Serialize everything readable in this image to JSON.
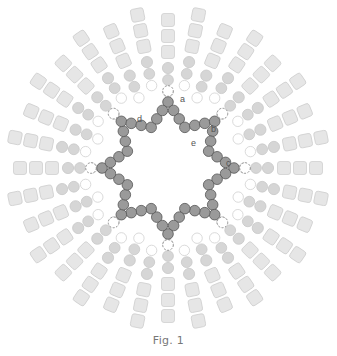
{
  "caption": "Fig. 1",
  "labels": [
    "a",
    "b",
    "c",
    "d",
    "e"
  ],
  "structure": {
    "spoke_count": 32,
    "inner_star_points": 8,
    "spoke_layers": [
      "white-bead",
      "gray-bead",
      "gray-bead",
      "cube",
      "cube",
      "cube"
    ]
  },
  "colors": {
    "cube_fill": "#e6e6e6",
    "cube_stroke": "#cfcfcf",
    "gray_bead": "#d6d6d6",
    "white_bead_stroke": "#d0d0d0",
    "ring_bead": "#9a9a9a",
    "ring_stroke": "#555555",
    "accent_bead_stroke": "#777777"
  }
}
